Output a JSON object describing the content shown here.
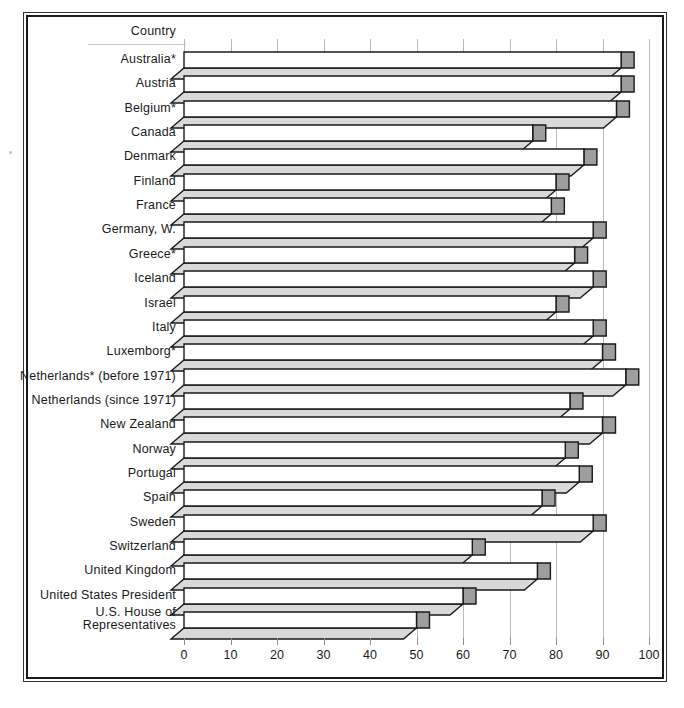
{
  "chart_data": {
    "type": "bar",
    "orientation": "horizontal",
    "title": "",
    "xlabel": "",
    "ylabel": "Country",
    "header_label": "Country",
    "xlim": [
      0,
      100
    ],
    "xticks": [
      0,
      10,
      20,
      30,
      40,
      50,
      60,
      70,
      80,
      90,
      100
    ],
    "xtick_labels": [
      "0",
      "10",
      "20",
      "30",
      "40",
      "50",
      "60",
      "70",
      "80",
      "90",
      "100"
    ],
    "grid": true,
    "legend": "none",
    "style": "3d-shaded-bars",
    "colors": {
      "bar_front": "#ffffff",
      "bar_top": "#d9d9d9",
      "bar_side": "#9e9e9e",
      "outline": "#1a1a1a",
      "gridline": "#b9b9b9",
      "text": "#1a1a1a"
    },
    "categories": [
      "Australia*",
      "Austria",
      "Belgium*",
      "Canada",
      "Denmark",
      "Finland",
      "France",
      "Germany, W.",
      "Greece*",
      "Iceland",
      "Israel",
      "Italy",
      "Luxemborg*",
      "Netherlands* (before 1971)",
      "Netherlands (since 1971)",
      "New Zealand",
      "Norway",
      "Portugal",
      "Spain",
      "Sweden",
      "Switzerland",
      "United Kingdom",
      "United States President",
      "U.S. House of Representatives"
    ],
    "values": [
      94,
      94,
      93,
      75,
      86,
      80,
      79,
      88,
      84,
      88,
      80,
      88,
      90,
      95,
      83,
      90,
      82,
      85,
      77,
      88,
      62,
      76,
      60,
      50
    ]
  },
  "rows": [
    {
      "label": "Australia*",
      "value": 94
    },
    {
      "label": "Austria",
      "value": 94
    },
    {
      "label": "Belgium*",
      "value": 93
    },
    {
      "label": "Canada",
      "value": 75
    },
    {
      "label": "Denmark",
      "value": 86
    },
    {
      "label": "Finland",
      "value": 80
    },
    {
      "label": "France",
      "value": 79
    },
    {
      "label": "Germany, W.",
      "value": 88
    },
    {
      "label": "Greece*",
      "value": 84
    },
    {
      "label": "Iceland",
      "value": 88
    },
    {
      "label": "Israel",
      "value": 80
    },
    {
      "label": "Italy",
      "value": 88
    },
    {
      "label": "Luxemborg*",
      "value": 90
    },
    {
      "label": "Netherlands* (before 1971)",
      "value": 95
    },
    {
      "label": "Netherlands (since 1971)",
      "value": 83
    },
    {
      "label": "New Zealand",
      "value": 90
    },
    {
      "label": "Norway",
      "value": 82
    },
    {
      "label": "Portugal",
      "value": 85
    },
    {
      "label": "Spain",
      "value": 77
    },
    {
      "label": "Sweden",
      "value": 88
    },
    {
      "label": "Switzerland",
      "value": 62
    },
    {
      "label": "United Kingdom",
      "value": 76
    },
    {
      "label": "United States President",
      "value": 60
    },
    {
      "label": "U.S. House of\nRepresentatives",
      "value": 50
    }
  ],
  "header": {
    "label": "Country"
  }
}
